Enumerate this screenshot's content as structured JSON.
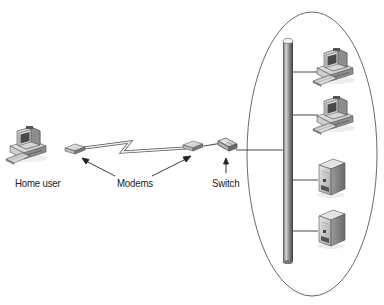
{
  "diagram": {
    "type": "network-topology",
    "labels": {
      "home_user": "Home user",
      "modems": "Modems",
      "switch": "Switch"
    },
    "nodes": [
      {
        "id": "home-pc",
        "kind": "desktop-computer",
        "label": "Home user"
      },
      {
        "id": "modem-home",
        "kind": "modem"
      },
      {
        "id": "modem-office",
        "kind": "modem"
      },
      {
        "id": "switch",
        "kind": "switch",
        "label": "Switch"
      },
      {
        "id": "backbone",
        "kind": "bus-cable"
      },
      {
        "id": "office-pc-1",
        "kind": "desktop-computer"
      },
      {
        "id": "office-pc-2",
        "kind": "desktop-computer"
      },
      {
        "id": "server-1",
        "kind": "tower-server"
      },
      {
        "id": "server-2",
        "kind": "tower-server"
      }
    ],
    "edges": [
      {
        "from": "modem-home",
        "to": "modem-office",
        "style": "wan-lightning"
      },
      {
        "from": "modem-office",
        "to": "switch",
        "style": "line"
      },
      {
        "from": "switch",
        "to": "backbone",
        "style": "line"
      },
      {
        "from": "backbone",
        "to": "office-pc-1",
        "style": "line"
      },
      {
        "from": "backbone",
        "to": "office-pc-2",
        "style": "line"
      },
      {
        "from": "backbone",
        "to": "server-1",
        "style": "line"
      },
      {
        "from": "backbone",
        "to": "server-2",
        "style": "line"
      }
    ],
    "groups": [
      {
        "id": "office-lan",
        "shape": "ellipse",
        "members": [
          "backbone",
          "office-pc-1",
          "office-pc-2",
          "server-1",
          "server-2"
        ]
      }
    ],
    "colors": {
      "line": "#333333",
      "device_light": "#e2e2e2",
      "device_mid": "#a8a8a8",
      "device_dark": "#5a5a5a",
      "screen": "#4a4a4a"
    }
  }
}
